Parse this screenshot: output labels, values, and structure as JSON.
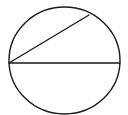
{
  "diagram": {
    "type": "geometry",
    "canvas": {
      "width": 128,
      "height": 115,
      "background": "#ffffff"
    },
    "stroke_color": "#1a1a1a",
    "stroke_width": 1.4,
    "circle": {
      "cx": 64.5,
      "cy": 60.5,
      "rx": 55.5,
      "ry": 53.5
    },
    "diameter": {
      "x1": 9,
      "y1": 63,
      "x2": 120,
      "y2": 63
    },
    "chord": {
      "x1": 9,
      "y1": 63,
      "x2": 89,
      "y2": 15
    },
    "labels": []
  }
}
